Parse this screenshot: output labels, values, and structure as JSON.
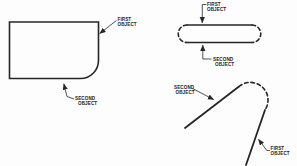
{
  "figure": {
    "background_color": "#fdfdfd",
    "line_color": "#262626",
    "text_color": "#222222",
    "diagrams": [
      {
        "name": "rounded-corner-rectangle",
        "description_style": "rectangle with filleted bottom-right corner",
        "first_label": [
          "FIRST",
          "OBJECT"
        ],
        "second_label": [
          "SECOND",
          "OBJECT"
        ]
      },
      {
        "name": "slot-with-dashed-end-caps",
        "description_style": "obround slot, solid top/bottom edges, dashed semicircular ends",
        "first_label": [
          "FIRST",
          "OBJECT"
        ],
        "second_label": [
          "SECOND",
          "OBJECT"
        ]
      },
      {
        "name": "two-lines-with-dashed-fillet-arc",
        "description_style": "two angled lines joined by a dashed fillet arc",
        "first_label": [
          "FIRST",
          "OBJECT"
        ],
        "second_label": [
          "SECOND",
          "OBJECT"
        ]
      }
    ]
  }
}
